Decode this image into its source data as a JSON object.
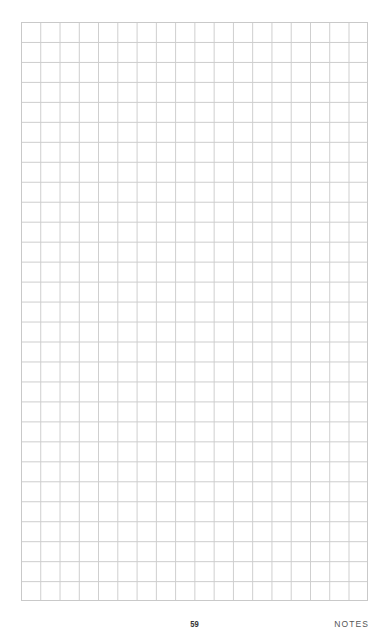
{
  "page": {
    "type": "grid-notes-page",
    "grid": {
      "columns": 18,
      "rows": 29,
      "line_color": "#cdcdcd"
    },
    "footer": {
      "page_number": "59",
      "section_label": "NOTES"
    }
  }
}
